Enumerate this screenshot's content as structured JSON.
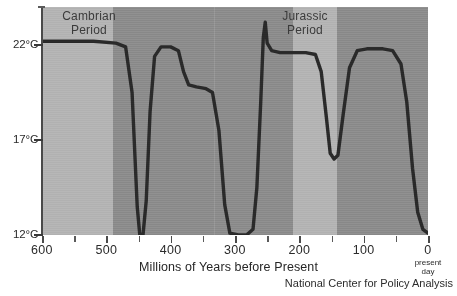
{
  "chart_data": {
    "type": "line",
    "title": "",
    "xlabel": "Millions of Years before Present",
    "ylabel": "",
    "xlim": [
      600,
      0
    ],
    "ylim": [
      12,
      24
    ],
    "grid": false,
    "legend": "none",
    "x_ticks_labeled": [
      "600",
      "500",
      "400",
      "300",
      "200",
      "100",
      "0"
    ],
    "x_tick_values": [
      600,
      500,
      400,
      300,
      200,
      100,
      0
    ],
    "x_minor_tick_values": [
      550,
      450,
      350,
      250,
      150,
      50
    ],
    "y_ticks_labeled": [
      "22°C",
      "17°C",
      "12°C"
    ],
    "y_tick_values": [
      22,
      17,
      12
    ],
    "axis_end_note": "present\nday",
    "series": [
      {
        "name": "Global temperature",
        "units": "°C",
        "points": [
          [
            600,
            22.2
          ],
          [
            560,
            22.2
          ],
          [
            520,
            22.2
          ],
          [
            485,
            22.1
          ],
          [
            470,
            21.9
          ],
          [
            460,
            19.5
          ],
          [
            452,
            13.5
          ],
          [
            448,
            12.0
          ],
          [
            443,
            12.0
          ],
          [
            438,
            13.8
          ],
          [
            432,
            18.5
          ],
          [
            425,
            21.4
          ],
          [
            415,
            21.9
          ],
          [
            400,
            21.9
          ],
          [
            388,
            21.7
          ],
          [
            380,
            20.6
          ],
          [
            372,
            19.9
          ],
          [
            360,
            19.8
          ],
          [
            345,
            19.7
          ],
          [
            335,
            19.5
          ],
          [
            325,
            17.5
          ],
          [
            316,
            13.6
          ],
          [
            308,
            12.1
          ],
          [
            295,
            12.0
          ],
          [
            282,
            12.0
          ],
          [
            272,
            12.3
          ],
          [
            266,
            14.5
          ],
          [
            260,
            19.0
          ],
          [
            256,
            22.4
          ],
          [
            253,
            23.2
          ],
          [
            250,
            22.1
          ],
          [
            243,
            21.7
          ],
          [
            230,
            21.6
          ],
          [
            210,
            21.6
          ],
          [
            190,
            21.6
          ],
          [
            175,
            21.5
          ],
          [
            166,
            20.6
          ],
          [
            158,
            18.2
          ],
          [
            152,
            16.3
          ],
          [
            146,
            16.0
          ],
          [
            140,
            16.2
          ],
          [
            132,
            18.3
          ],
          [
            122,
            20.8
          ],
          [
            110,
            21.7
          ],
          [
            95,
            21.8
          ],
          [
            70,
            21.8
          ],
          [
            55,
            21.7
          ],
          [
            42,
            21.0
          ],
          [
            33,
            19.0
          ],
          [
            24,
            15.5
          ],
          [
            16,
            13.2
          ],
          [
            8,
            12.3
          ],
          [
            0,
            12.1
          ]
        ]
      }
    ],
    "shaded_bands": [
      {
        "label": "Cambrian Period",
        "x_start": 600,
        "x_end": 530,
        "color": "#b4b4b4"
      },
      {
        "label": "Jurassic Period",
        "x_start": 208,
        "x_end": 160,
        "color": "#b4b4b4"
      }
    ],
    "background_color": "#8e8e8e",
    "line_color": "#2a2a2a"
  },
  "annotations": {
    "cambrian": {
      "line1": "Cambrian",
      "line2": "Period"
    },
    "jurassic": {
      "line1": "Jurassic",
      "line2": "Period"
    }
  },
  "footer": {
    "credit": "National Center for Policy Analysis"
  },
  "present_day": {
    "line1": "present",
    "line2": "day"
  }
}
